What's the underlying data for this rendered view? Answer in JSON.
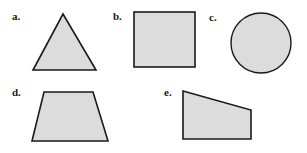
{
  "figure": {
    "background_color": "#ffffff",
    "shape_fill_color": "#dcdcdc",
    "shape_stroke_color": "#1a1a1a",
    "label_color": "#1a1a1a",
    "items": [
      {
        "label": "a.",
        "shape_name": "triangle",
        "geometry": "polygon",
        "points": "63,14 96,70 33,70"
      },
      {
        "label": "b.",
        "shape_name": "square",
        "geometry": "rect",
        "x": 134,
        "y": 12,
        "width": 61,
        "height": 55
      },
      {
        "label": "c.",
        "shape_name": "circle",
        "geometry": "circle",
        "cx": 261,
        "cy": 43,
        "r": 30
      },
      {
        "label": "d.",
        "shape_name": "trapezoid",
        "geometry": "polygon",
        "points": "44,92 93,92 108,141 32,141"
      },
      {
        "label": "e.",
        "shape_name": "quadrilateral",
        "geometry": "polygon",
        "points": "183,91 251,110 251,139 183,139"
      }
    ]
  }
}
